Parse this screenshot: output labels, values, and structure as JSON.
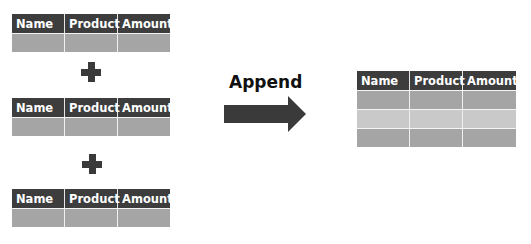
{
  "top_caption": "",
  "source_tables": [
    {
      "columns": [
        "Name",
        "Product",
        "Amount"
      ],
      "rows": 1
    },
    {
      "columns": [
        "Name",
        "Product",
        "Amount"
      ],
      "rows": 1
    },
    {
      "columns": [
        "Name",
        "Product",
        "Amount"
      ],
      "rows": 1
    }
  ],
  "operator_symbol": "+",
  "operation": {
    "label": "Append",
    "arrow": "right-arrow"
  },
  "result_table": {
    "columns": [
      "Name",
      "Product",
      "Amount"
    ],
    "rows": 3
  },
  "colors": {
    "header_bg": "#3d3d3d",
    "header_text": "#ffffff",
    "row_dark": "#a5a5a5",
    "row_light": "#c9c9c9",
    "arrow": "#3a3a3a",
    "plus": "#3a3a3a"
  },
  "bottom_caption": ""
}
